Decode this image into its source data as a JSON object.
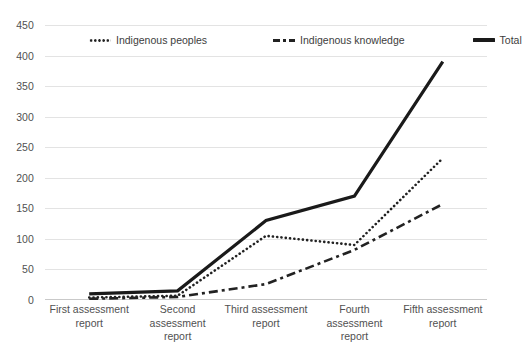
{
  "chart_data": {
    "type": "line",
    "title": "",
    "subtitle": "",
    "xlabel": "",
    "ylabel": "",
    "categories": [
      "First assessment report",
      "Second assessment report",
      "Third assessment report",
      "Fourth assessment report",
      "Fifth assessment report"
    ],
    "series": [
      {
        "name": "Indigenous peoples",
        "style": "dotted",
        "color": "#222222",
        "values": [
          4,
          7,
          105,
          90,
          232
        ]
      },
      {
        "name": "Indigenous knowledge",
        "style": "dash-dot",
        "color": "#222222",
        "values": [
          2,
          5,
          26,
          82,
          157
        ]
      },
      {
        "name": "Total",
        "style": "solid",
        "color": "#1a1a1a",
        "values": [
          10,
          15,
          130,
          170,
          390
        ]
      }
    ],
    "ylim": [
      0,
      450
    ],
    "ytick_values": [
      0,
      50,
      100,
      150,
      200,
      250,
      300,
      350,
      400,
      450
    ],
    "ytick_labels": [
      "0",
      "50",
      "100",
      "150",
      "200",
      "250",
      "300",
      "350",
      "400",
      "450"
    ],
    "grid": true,
    "grid_axis": "y",
    "legend_position": "top-inside"
  },
  "legend": {
    "items": [
      {
        "label": "Indigenous peoples",
        "swatch": "dotted-line-icon"
      },
      {
        "label": "Indigenous knowledge",
        "swatch": "dash-dot-line-icon"
      },
      {
        "label": "Total",
        "swatch": "solid-line-icon"
      }
    ]
  }
}
